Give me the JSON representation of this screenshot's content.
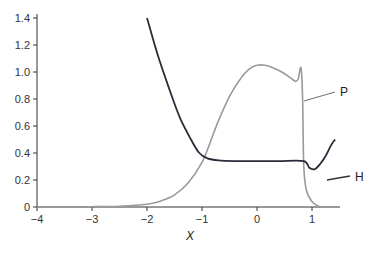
{
  "chart_data": {
    "type": "line",
    "title": "",
    "xlabel": "X",
    "ylabel": "",
    "xlim": [
      -4,
      1.5
    ],
    "ylim": [
      0,
      1.4
    ],
    "grid": false,
    "legend": "inline labels at right",
    "x_ticks": [
      "-4",
      "-3",
      "-2",
      "-1",
      "0",
      "1"
    ],
    "y_ticks": [
      "0",
      "0.2",
      "0.4",
      "0.6",
      "0.8",
      "1.0",
      "1.2",
      "1.4"
    ],
    "series": [
      {
        "name": "P",
        "color": "#9a9a9a",
        "points": [
          [
            -4,
            0
          ],
          [
            -3,
            0.002
          ],
          [
            -2.5,
            0.006
          ],
          [
            -2,
            0.02
          ],
          [
            -1.75,
            0.045
          ],
          [
            -1.5,
            0.09
          ],
          [
            -1.25,
            0.18
          ],
          [
            -1,
            0.33
          ],
          [
            -0.85,
            0.48
          ],
          [
            -0.7,
            0.64
          ],
          [
            -0.5,
            0.82
          ],
          [
            -0.3,
            0.95
          ],
          [
            -0.15,
            1.02
          ],
          [
            0,
            1.05
          ],
          [
            0.15,
            1.05
          ],
          [
            0.3,
            1.03
          ],
          [
            0.45,
            1.0
          ],
          [
            0.6,
            0.96
          ],
          [
            0.7,
            0.93
          ],
          [
            0.75,
            0.95
          ],
          [
            0.8,
            1.03
          ],
          [
            0.83,
            0.8
          ],
          [
            0.85,
            0.3
          ],
          [
            0.9,
            0.12
          ],
          [
            1.0,
            0.04
          ],
          [
            1.1,
            0.01
          ],
          [
            1.2,
            0.0
          ],
          [
            1.5,
            0.0
          ]
        ]
      },
      {
        "name": "H",
        "color": "#2b2b3a",
        "points": [
          [
            -2,
            1.4
          ],
          [
            -1.8,
            1.12
          ],
          [
            -1.6,
            0.88
          ],
          [
            -1.4,
            0.66
          ],
          [
            -1.2,
            0.5
          ],
          [
            -1.05,
            0.4
          ],
          [
            -0.9,
            0.36
          ],
          [
            -0.7,
            0.345
          ],
          [
            -0.4,
            0.34
          ],
          [
            0,
            0.34
          ],
          [
            0.4,
            0.34
          ],
          [
            0.85,
            0.34
          ],
          [
            0.95,
            0.29
          ],
          [
            1.05,
            0.28
          ],
          [
            1.15,
            0.32
          ],
          [
            1.25,
            0.38
          ],
          [
            1.35,
            0.46
          ],
          [
            1.42,
            0.5
          ]
        ]
      }
    ],
    "annotations": [
      {
        "text": "P",
        "x": 1.45,
        "y": 0.97
      },
      {
        "text": "H",
        "x": 1.62,
        "y": 0.34
      }
    ]
  },
  "axes": {
    "xlabel": "X",
    "x_ticks": [
      "-4",
      "-3",
      "-2",
      "-1",
      "0",
      "1"
    ],
    "y_ticks": [
      "0",
      "0.2",
      "0.4",
      "0.6",
      "0.8",
      "1.0",
      "1.2",
      "1.4"
    ]
  },
  "labels": {
    "p": "P",
    "h": "H"
  }
}
